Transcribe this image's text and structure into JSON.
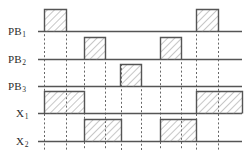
{
  "figure": {
    "type": "timing-diagram",
    "title": "",
    "width": 247,
    "height": 157,
    "background_color": "#ffffff",
    "line_color": "#555555",
    "dashed_line_color": "#666666",
    "hatch_color": "#8a8a8a",
    "label_color": "#2b2b2b",
    "axis_x_start": 38,
    "axis_x_end": 242,
    "pulse_height": 22
  },
  "signals": [
    {
      "label": "PB",
      "subscript": "1",
      "name": "PB1",
      "baseline_y": 31,
      "label_x": 8,
      "pulses": [
        {
          "x_start": 44,
          "x_end": 66
        },
        {
          "x_start": 196,
          "x_end": 218
        }
      ]
    },
    {
      "label": "PB",
      "subscript": "2",
      "name": "PB2",
      "baseline_y": 59,
      "label_x": 8,
      "pulses": [
        {
          "x_start": 84,
          "x_end": 105
        },
        {
          "x_start": 160,
          "x_end": 181
        }
      ]
    },
    {
      "label": "PB",
      "subscript": "3",
      "name": "PB3",
      "baseline_y": 86,
      "label_x": 8,
      "pulses": [
        {
          "x_start": 120,
          "x_end": 141
        }
      ]
    },
    {
      "label": "X",
      "subscript": "1",
      "name": "X1",
      "baseline_y": 113,
      "label_x": 16,
      "pulses": [
        {
          "x_start": 44,
          "x_end": 84
        },
        {
          "x_start": 196,
          "x_end": 242
        }
      ]
    },
    {
      "label": "X",
      "subscript": "2",
      "name": "X2",
      "baseline_y": 141,
      "label_x": 16,
      "pulses": [
        {
          "x_start": 84,
          "x_end": 121
        },
        {
          "x_start": 160,
          "x_end": 196
        }
      ]
    }
  ],
  "guide_lines": [
    {
      "x": 44,
      "y_top": 9,
      "y_bottom": 150
    },
    {
      "x": 66,
      "y_top": 9,
      "y_bottom": 150
    },
    {
      "x": 84,
      "y_top": 37,
      "y_bottom": 150
    },
    {
      "x": 105,
      "y_top": 37,
      "y_bottom": 150
    },
    {
      "x": 121,
      "y_top": 64,
      "y_bottom": 150
    },
    {
      "x": 141,
      "y_top": 64,
      "y_bottom": 150
    },
    {
      "x": 160,
      "y_top": 37,
      "y_bottom": 150
    },
    {
      "x": 181,
      "y_top": 37,
      "y_bottom": 150
    },
    {
      "x": 196,
      "y_top": 9,
      "y_bottom": 150
    },
    {
      "x": 218,
      "y_top": 9,
      "y_bottom": 150
    }
  ]
}
